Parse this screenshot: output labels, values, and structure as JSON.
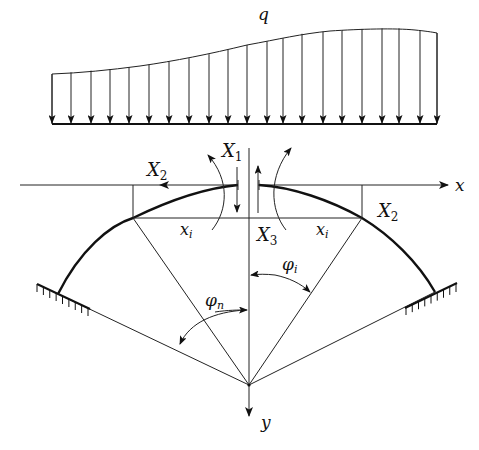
{
  "figure": {
    "type": "arch-structural-diagram"
  },
  "load": {
    "label": "q",
    "arrow_count": 21,
    "arrow_x": [
      52,
      71,
      91,
      110,
      129,
      149,
      169,
      189,
      209,
      228,
      247,
      267,
      283,
      302,
      323,
      342,
      362,
      382,
      399,
      420,
      437
    ],
    "baseline_y": 124
  },
  "labels": {
    "q": "q",
    "x1_main": "X",
    "x1_sub": "1",
    "x2_left_main": "X",
    "x2_left_sub": "2",
    "x2_right_main": "X",
    "x2_right_sub": "2",
    "x3_main": "X",
    "x3_sub": "3",
    "xi_left_main": "x",
    "xi_left_sub": "i",
    "xi_right_main": "x",
    "xi_right_sub": "i",
    "phi_n_main": "φ",
    "phi_n_sub": "n",
    "phi_i_main": "φ",
    "phi_i_sub": "i",
    "x_axis": "x",
    "y_axis": "y"
  },
  "colors": {
    "ink": "#111111",
    "background": "#ffffff"
  }
}
